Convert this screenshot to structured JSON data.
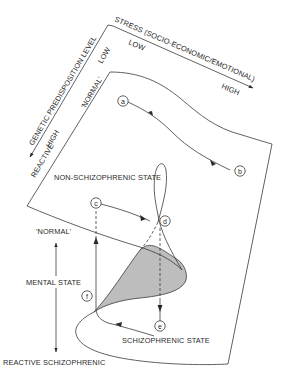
{
  "diagram": {
    "axes": {
      "stress": {
        "title": "STRESS (SOCIO-ECONOMIC/EMOTIONAL)",
        "low": "LOW",
        "high": "HIGH"
      },
      "genetic": {
        "title": "GENETIC PREDISPOSITION LEVEL",
        "low": "LOW",
        "high": "HIGH"
      },
      "mental_state": {
        "title": "MENTAL STATE",
        "top": "'NORMAL'",
        "bottom": "REACTIVE SCHIZOPHRENIC"
      }
    },
    "surface_labels": {
      "normal_edge": "'NORMAL'",
      "reactive_edge": "REACTIVE",
      "upper_state": "NON-SCHIZOPHRENIC STATE",
      "lower_state": "SCHIZOPHRENIC STATE"
    },
    "nodes": [
      {
        "id": "a",
        "label": "a"
      },
      {
        "id": "b",
        "label": "b"
      },
      {
        "id": "c",
        "label": "c"
      },
      {
        "id": "d",
        "label": "d"
      },
      {
        "id": "e",
        "label": "e"
      },
      {
        "id": "f",
        "label": "f"
      }
    ],
    "colors": {
      "ink": "#3a3a3a",
      "shaded_fold": "#bdbdbd",
      "background": "#ffffff"
    }
  }
}
